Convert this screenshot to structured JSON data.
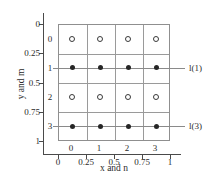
{
  "figure": {
    "x_axis_label": "x and n",
    "y_axis_label": "y and m",
    "x_tick_labels": [
      "0",
      "0.25",
      "0.5",
      "0.75",
      "1"
    ],
    "y_tick_labels": [
      "0",
      "0.25",
      "0.5",
      "0.75",
      "1"
    ],
    "inner_row_labels": [
      "0",
      "1",
      "2",
      "3"
    ],
    "inner_col_labels": [
      "0",
      "1",
      "2",
      "3"
    ]
  },
  "colors": {
    "background": "#ffffff",
    "axis": "#4a4a4a",
    "grid": "#9a9a9a",
    "scan_line": "#8a8a8a",
    "marker_fill": "#262626",
    "text": "#2b2b2b"
  },
  "chart_data": {
    "type": "scatter",
    "title": "",
    "xlabel": "x and n",
    "ylabel": "y and m",
    "xlim": [
      0,
      1
    ],
    "ylim": [
      0,
      1
    ],
    "y_axis_direction": "inverted",
    "x_ticks": [
      0,
      0.25,
      0.5,
      0.75,
      1
    ],
    "y_ticks": [
      0,
      0.25,
      0.5,
      0.75,
      1
    ],
    "grid": true,
    "grid_rows_m": [
      0,
      1,
      2,
      3
    ],
    "grid_cols_n": [
      0,
      1,
      2,
      3
    ],
    "series": [
      {
        "name": "row-0-samples",
        "marker": "open-circle",
        "points": [
          [
            0.125,
            0.125
          ],
          [
            0.375,
            0.125
          ],
          [
            0.625,
            0.125
          ],
          [
            0.875,
            0.125
          ]
        ]
      },
      {
        "name": "row-1-samples",
        "marker": "filled-circle",
        "line_label": "l(1)",
        "line_y": 0.375,
        "points": [
          [
            0.125,
            0.375
          ],
          [
            0.375,
            0.375
          ],
          [
            0.625,
            0.375
          ],
          [
            0.875,
            0.375
          ]
        ]
      },
      {
        "name": "row-2-samples",
        "marker": "open-circle",
        "points": [
          [
            0.125,
            0.625
          ],
          [
            0.375,
            0.625
          ],
          [
            0.625,
            0.625
          ],
          [
            0.875,
            0.625
          ]
        ]
      },
      {
        "name": "row-3-samples",
        "marker": "filled-circle",
        "line_label": "l(3)",
        "line_y": 0.875,
        "points": [
          [
            0.125,
            0.875
          ],
          [
            0.375,
            0.875
          ],
          [
            0.625,
            0.875
          ],
          [
            0.875,
            0.875
          ]
        ]
      }
    ],
    "annotations": [
      {
        "text": "l(1)",
        "at_row_m": 1
      },
      {
        "text": "l(3)",
        "at_row_m": 3
      }
    ]
  }
}
